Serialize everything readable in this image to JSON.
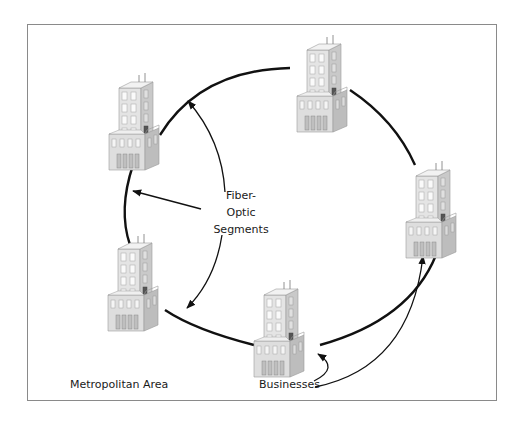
{
  "diagram": {
    "type": "ring-network",
    "center_label": {
      "line1": "Fiber-",
      "line2": "Optic",
      "line3": "Segments"
    },
    "area_label": "Metropolitan Area",
    "nodes_label": "Businesses",
    "nodes": [
      {
        "id": "building-top-left",
        "kind": "business-building"
      },
      {
        "id": "building-top-right",
        "kind": "business-building"
      },
      {
        "id": "building-right",
        "kind": "business-building"
      },
      {
        "id": "building-bottom",
        "kind": "business-building"
      },
      {
        "id": "building-left-bottom",
        "kind": "business-building"
      }
    ],
    "colors": {
      "ring": "#111111",
      "frame": "#8a8a8a",
      "building_light": "#e6e6e6",
      "building_mid": "#c8c8c8",
      "building_dark": "#9a9a9a",
      "text": "#1a1a1a"
    }
  }
}
